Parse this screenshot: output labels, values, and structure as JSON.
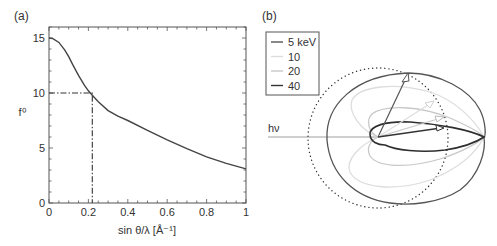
{
  "chart_data": [
    {
      "panel": "(a)",
      "type": "line",
      "title": "",
      "xlabel": "sin θ/λ [Å⁻¹]",
      "ylabel": "f⁰",
      "xlim": [
        0,
        1
      ],
      "ylim": [
        0,
        16
      ],
      "xticks": [
        "0",
        "0.2",
        "0.4",
        "0.6",
        "0.8",
        "1"
      ],
      "yticks": [
        "0",
        "5",
        "10",
        "15"
      ],
      "grid": false,
      "series": [
        {
          "name": "f0",
          "x": [
            0,
            0.02,
            0.05,
            0.08,
            0.1,
            0.12,
            0.15,
            0.18,
            0.2,
            0.22,
            0.25,
            0.3,
            0.35,
            0.4,
            0.5,
            0.6,
            0.7,
            0.8,
            0.9,
            1.0
          ],
          "y": [
            15.0,
            14.95,
            14.6,
            13.9,
            13.3,
            12.6,
            11.6,
            10.7,
            10.2,
            9.8,
            9.2,
            8.4,
            7.9,
            7.5,
            6.6,
            5.75,
            4.95,
            4.2,
            3.6,
            3.1
          ]
        }
      ],
      "annotations": [
        {
          "type": "dash-dot",
          "from": [
            0,
            10
          ],
          "to": [
            0.22,
            10
          ]
        },
        {
          "type": "dash-dot",
          "from": [
            0.22,
            10
          ],
          "to": [
            0.22,
            0
          ]
        }
      ]
    },
    {
      "panel": "(b)",
      "type": "polar",
      "title": "",
      "incident_label": "hν",
      "legend": {
        "position": "upper-left",
        "entries": [
          {
            "label": "5 keV",
            "color": "#555555"
          },
          {
            "label": "10",
            "color": "#dddddd"
          },
          {
            "label": "20",
            "color": "#c8c8c8"
          },
          {
            "label": "40",
            "color": "#333333"
          }
        ]
      },
      "reference": "dotted circle (isotropic)",
      "series": [
        {
          "name": "5 keV",
          "shape": "broad ellipse, max direction ~65° forward"
        },
        {
          "name": "10",
          "shape": "forward-elongated lobe, max ~30°"
        },
        {
          "name": "20",
          "shape": "narrower forward lobe, max ~20°"
        },
        {
          "name": "40",
          "shape": "narrow forward lobe, max ~8°"
        }
      ]
    }
  ],
  "panels": {
    "a": {
      "label": "(a)",
      "xlabel": "sin θ/λ [Å⁻¹]",
      "ylabel": "f⁰",
      "xticks": [
        "0",
        "0.2",
        "0.4",
        "0.6",
        "0.8",
        "1"
      ],
      "yticks": [
        "0",
        "5",
        "10",
        "15"
      ]
    },
    "b": {
      "label": "(b)",
      "hv": "hν",
      "legend": [
        "5 keV",
        "10",
        "20",
        "40"
      ]
    }
  }
}
